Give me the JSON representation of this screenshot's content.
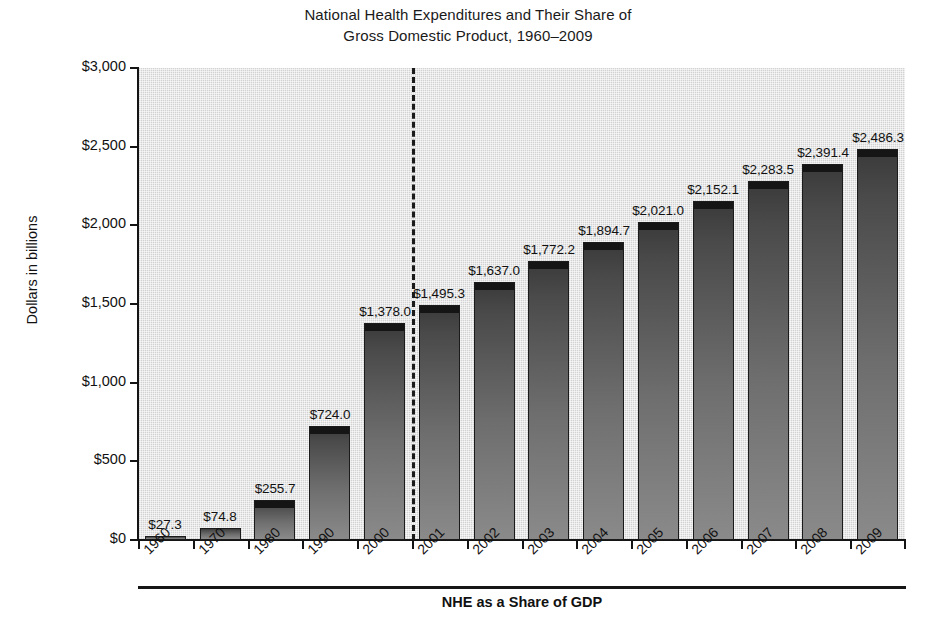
{
  "title": {
    "line1": "National Health Expenditures and Their Share of",
    "line2": "Gross Domestic Product, 1960–2009"
  },
  "axes": {
    "y_title": "Dollars in billions",
    "y_ticks": [
      "$3,000",
      "$2,500",
      "$2,000",
      "$1,500",
      "$1,000",
      "$500",
      "$0"
    ]
  },
  "footer": {
    "title": "NHE as a Share of GDP"
  },
  "chart_data": {
    "type": "bar",
    "title": "National Health Expenditures and Their Share of Gross Domestic Product, 1960–2009",
    "xlabel": "",
    "ylabel": "Dollars in billions",
    "ylim": [
      0,
      3000
    ],
    "ytick_values": [
      3000,
      2500,
      2000,
      1500,
      1000,
      500,
      0
    ],
    "ytick_labels": [
      "$3,000",
      "$2,500",
      "$2,000",
      "$1,500",
      "$1,000",
      "$500",
      "$0"
    ],
    "grid": false,
    "legend": null,
    "categories": [
      "1960",
      "1970",
      "1980",
      "1990",
      "2000",
      "2001",
      "2002",
      "2003",
      "2004",
      "2005",
      "2006",
      "2007",
      "2008",
      "2009"
    ],
    "values": [
      27.3,
      74.8,
      255.7,
      724.0,
      1378.0,
      1495.3,
      1637.0,
      1772.2,
      1894.7,
      2021.0,
      2152.1,
      2283.5,
      2391.4,
      2486.3
    ],
    "value_labels": [
      "$27.3",
      "$74.8",
      "$255.7",
      "$724.0",
      "$1,378.0",
      "$1,495.3",
      "$1,637.0",
      "$1,772.2",
      "$1,894.7",
      "$2,021.0",
      "$2,152.1",
      "$2,283.5",
      "$2,391.4",
      "$2,486.3"
    ],
    "annotations": [
      {
        "type": "vertical-dashed-line",
        "between": [
          "2000",
          "2001"
        ]
      }
    ],
    "secondary_row": {
      "label": "NHE as a Share of GDP",
      "values": [
        "",
        "",
        "",
        "",
        "",
        "",
        "",
        "",
        "",
        "",
        "",
        "",
        "",
        ""
      ]
    }
  }
}
